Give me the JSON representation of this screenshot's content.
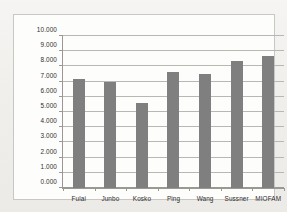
{
  "chart_data": {
    "type": "bar",
    "title": "",
    "xlabel": "",
    "ylabel": "",
    "categories": [
      "Fulai",
      "Junbo",
      "Kosko",
      "Ping",
      "Wang",
      "Sussner",
      "MIOFAM"
    ],
    "values": [
      7.15,
      7.0,
      5.6,
      7.65,
      7.5,
      8.35,
      8.7
    ],
    "ylim": [
      0,
      10
    ],
    "ytick_values": [
      0,
      1,
      2,
      3,
      4,
      5,
      6,
      7,
      8,
      9,
      10
    ],
    "ytick_labels": [
      "0.000",
      "1.000",
      "2.000",
      "3.000",
      "4.000",
      "5.000",
      "6.000",
      "7.000",
      "8.000",
      "9.000",
      "10.000"
    ],
    "grid": true,
    "legend": "none",
    "bar_color": "#7f7f7f",
    "gridline_color": "#b9b7b3",
    "axis_color": "#9a9894",
    "plot_background": "#fdfdfc",
    "frame_color": "#c9c7c4"
  }
}
